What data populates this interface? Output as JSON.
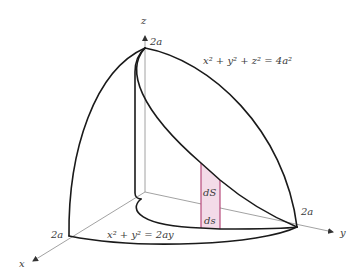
{
  "figure": {
    "type": "3d-surface-area-diagram",
    "colors": {
      "curve": "#1a1a1a",
      "axis": "#8a8a8a",
      "strip_fill": "#f3dbe8",
      "strip_stroke": "#b03a6e",
      "text": "#3a3a3a"
    },
    "axes": {
      "x_label": "x",
      "y_label": "y",
      "z_label": "z"
    },
    "tick_labels": {
      "x_intercept": "2a",
      "y_intercept": "2a",
      "z_intercept": "2a"
    },
    "equations": {
      "sphere": "x² + y² + z² = 4a²",
      "cylinder": "x² + y² = 2ay"
    },
    "strip_labels": {
      "surface_element": "dS",
      "arc_element": "ds"
    }
  }
}
